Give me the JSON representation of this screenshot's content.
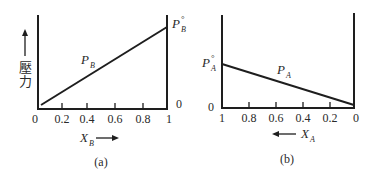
{
  "panels": [
    {
      "id": "a",
      "caption": "(a)",
      "y_axis_label": "壓力",
      "y_arrow": "up",
      "curve_label_main": "P",
      "curve_label_sub": "B",
      "right_top_label_main": "P",
      "right_top_label_sub": "B",
      "right_top_label_sup": "°",
      "right_zero_label": "0",
      "x_axis_label_main": "X",
      "x_axis_label_sub": "B",
      "x_arrow": "right",
      "x_ticks": [
        "0",
        "0.2",
        "0.4",
        "0.6",
        "0.8",
        "1"
      ]
    },
    {
      "id": "b",
      "caption": "(b)",
      "curve_label_main": "P",
      "curve_label_sub": "A",
      "left_top_label_main": "P",
      "left_top_label_sub": "A",
      "left_top_label_sup": "°",
      "left_zero_label": "0",
      "x_axis_label_main": "X",
      "x_axis_label_sub": "A",
      "x_arrow": "left",
      "x_ticks": [
        "1",
        "0.8",
        "0.6",
        "0.4",
        "0.2",
        "0"
      ]
    }
  ],
  "colors": {
    "line": "#1e1e1e",
    "text": "#2a2a2a",
    "background": "#ffffff"
  }
}
